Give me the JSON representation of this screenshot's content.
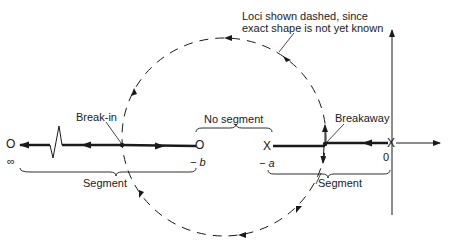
{
  "diagram": {
    "type": "root-locus-sketch",
    "annotation": {
      "line1": "Loci shown dashed, since",
      "line2": "exact shape is not yet known"
    },
    "labels": {
      "break_in": "Break-in",
      "breakaway": "Breakaway",
      "no_segment": "No segment",
      "segment_left": "Segment",
      "segment_right": "Segment"
    },
    "points": {
      "zero_infinity": {
        "symbol": "O",
        "label": "∞"
      },
      "zero_b": {
        "symbol": "O",
        "label": "− b"
      },
      "pole_a": {
        "symbol": "X",
        "label": "− a"
      },
      "pole_origin": {
        "symbol": "X",
        "label": "0"
      }
    },
    "colors": {
      "ink": "#1a1a1a",
      "background": "#ffffff"
    }
  }
}
